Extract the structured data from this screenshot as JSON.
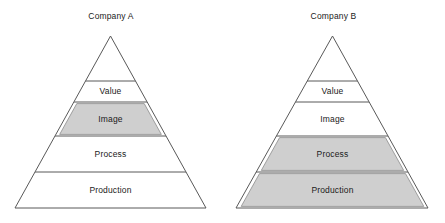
{
  "figures": [
    {
      "id": "company-a",
      "title": "Company A",
      "bands": [
        {
          "label": "Value",
          "highlighted": false
        },
        {
          "label": "Image",
          "highlighted": true
        },
        {
          "label": "Process",
          "highlighted": false
        },
        {
          "label": "Production",
          "highlighted": false
        }
      ]
    },
    {
      "id": "company-b",
      "title": "Company B",
      "bands": [
        {
          "label": "Value",
          "highlighted": false
        },
        {
          "label": "Image",
          "highlighted": false
        },
        {
          "label": "Process",
          "highlighted": true
        },
        {
          "label": "Production",
          "highlighted": true
        }
      ]
    }
  ],
  "colors": {
    "background": "#ffffff",
    "outline": "#595959",
    "highlight_fill": "#cfcfcf",
    "highlight_stroke": "#8c8c8c",
    "text": "#1a1a1a"
  },
  "chart_data": {
    "type": "diagram",
    "subtype": "segmented-pyramid-comparison",
    "title": "",
    "levels_bottom_to_top": [
      "Production",
      "Process",
      "Image",
      "Value"
    ],
    "figures": [
      {
        "name": "Company A",
        "highlighted_levels": [
          "Image"
        ],
        "levels": [
          {
            "label": "Value",
            "rank_from_top": 1,
            "highlighted": false
          },
          {
            "label": "Image",
            "rank_from_top": 2,
            "highlighted": true
          },
          {
            "label": "Process",
            "rank_from_top": 3,
            "highlighted": false
          },
          {
            "label": "Production",
            "rank_from_top": 4,
            "highlighted": false
          }
        ]
      },
      {
        "name": "Company B",
        "highlighted_levels": [
          "Process",
          "Production"
        ],
        "levels": [
          {
            "label": "Value",
            "rank_from_top": 1,
            "highlighted": false
          },
          {
            "label": "Image",
            "rank_from_top": 2,
            "highlighted": false
          },
          {
            "label": "Process",
            "rank_from_top": 3,
            "highlighted": true
          },
          {
            "label": "Production",
            "rank_from_top": 4,
            "highlighted": true
          }
        ]
      }
    ],
    "legend": [],
    "annotations": []
  },
  "geometry": {
    "apex_y": 36,
    "base_y": 208,
    "band_boundaries_y": [
      81,
      102,
      136,
      172
    ],
    "pyramid_a": {
      "apex_x": 110.5,
      "base_left_x": 15,
      "base_right_x": 206
    },
    "pyramid_b": {
      "apex_x": 332.5,
      "base_left_x": 236,
      "base_right_x": 428
    }
  }
}
